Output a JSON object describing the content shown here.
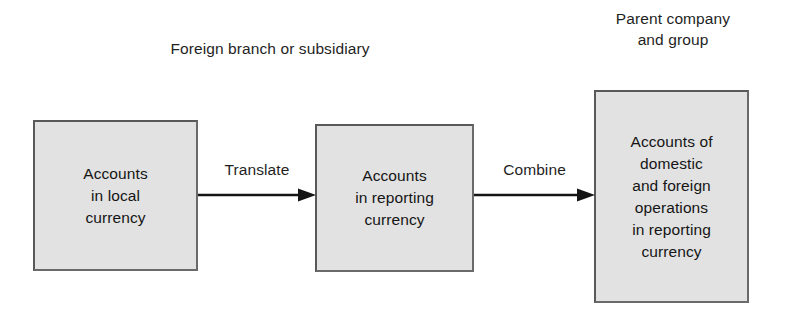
{
  "diagram": {
    "background_color": "#ffffff",
    "box_fill_color": "#e2e2e2",
    "box_border_color": "#6a6a6a",
    "text_color": "#151515",
    "captions": [
      {
        "id": "foreign",
        "text": "Foreign branch or subsidiary"
      },
      {
        "id": "parent",
        "text": "Parent company\nand group"
      }
    ],
    "boxes": [
      {
        "id": "local",
        "text": "Accounts\nin local\ncurrency",
        "lines": [
          "Accounts",
          "in local",
          "currency"
        ]
      },
      {
        "id": "reporting",
        "text": "Accounts\nin reporting\ncurrency",
        "lines": [
          "Accounts",
          "in reporting",
          "currency"
        ]
      },
      {
        "id": "combined",
        "text": "Accounts of\ndomestic\nand foreign\noperations\nin reporting\ncurrency",
        "lines": [
          "Accounts of",
          "domestic",
          "and foreign",
          "operations",
          "in reporting",
          "currency"
        ]
      }
    ],
    "arrows": [
      {
        "id": "translate",
        "label": "Translate",
        "from": "local",
        "to": "reporting",
        "icon": "arrow-right-icon"
      },
      {
        "id": "combine",
        "label": "Combine",
        "from": "reporting",
        "to": "combined",
        "icon": "arrow-right-icon"
      }
    ]
  }
}
